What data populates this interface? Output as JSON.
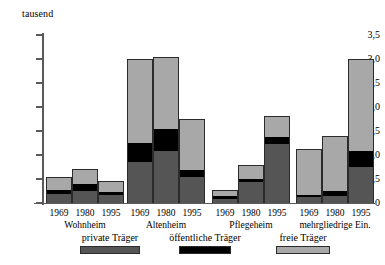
{
  "chart_data": {
    "type": "bar",
    "title": "",
    "subtitle": "",
    "unit_label": "tausend",
    "xlabel": "",
    "ylabel": "tausend",
    "ylim": [
      0,
      3.5
    ],
    "y_ticks": [
      "0",
      "0,5",
      "1,0",
      "1,5",
      "2,0",
      "2,5",
      "3,0",
      "3,5"
    ],
    "y_tick_values": [
      0,
      0.5,
      1.0,
      1.5,
      2.0,
      2.5,
      3.0,
      3.5
    ],
    "grid": false,
    "stacked": true,
    "legend_position": "bottom",
    "legend": [
      {
        "name": "private Träger",
        "color": "#555555"
      },
      {
        "name": "öffentliche Träger",
        "color": "#000000"
      },
      {
        "name": "freie Träger",
        "color": "#a8a8a8"
      }
    ],
    "series": [
      {
        "name": "private Träger",
        "color": "#555555",
        "values": [
          0.2,
          0.25,
          0.18,
          0.85,
          1.1,
          0.55,
          0.1,
          0.45,
          1.25,
          0.12,
          0.15,
          0.75
        ]
      },
      {
        "name": "öffentliche Träger",
        "color": "#000000",
        "values": [
          0.08,
          0.15,
          0.07,
          0.4,
          0.45,
          0.15,
          0.05,
          0.07,
          0.15,
          0.05,
          0.1,
          0.35
        ]
      },
      {
        "name": "freie Träger",
        "color": "#a8a8a8",
        "values": [
          0.27,
          0.3,
          0.2,
          1.75,
          1.5,
          1.05,
          0.13,
          0.28,
          0.42,
          0.95,
          1.15,
          1.9
        ]
      }
    ],
    "categories": [
      "1969",
      "1980",
      "1995",
      "1969",
      "1980",
      "1995",
      "1969",
      "1980",
      "1995",
      "1969",
      "1980",
      "1995"
    ],
    "groups": [
      {
        "label": "Wohnheim",
        "bars": [
          {
            "year": "1969",
            "private": 0.2,
            "oeffentlich": 0.08,
            "freie": 0.27,
            "total": 0.55
          },
          {
            "year": "1980",
            "private": 0.25,
            "oeffentlich": 0.15,
            "freie": 0.3,
            "total": 0.7
          },
          {
            "year": "1995",
            "private": 0.18,
            "oeffentlich": 0.07,
            "freie": 0.2,
            "total": 0.45
          }
        ]
      },
      {
        "label": "Altenheim",
        "bars": [
          {
            "year": "1969",
            "private": 0.85,
            "oeffentlich": 0.4,
            "freie": 1.75,
            "total": 3.0
          },
          {
            "year": "1980",
            "private": 1.1,
            "oeffentlich": 0.45,
            "freie": 1.5,
            "total": 3.05
          },
          {
            "year": "1995",
            "private": 0.55,
            "oeffentlich": 0.15,
            "freie": 1.05,
            "total": 1.75
          }
        ]
      },
      {
        "label": "Pflegeheim",
        "bars": [
          {
            "year": "1969",
            "private": 0.1,
            "oeffentlich": 0.05,
            "freie": 0.13,
            "total": 0.28
          },
          {
            "year": "1980",
            "private": 0.45,
            "oeffentlich": 0.07,
            "freie": 0.28,
            "total": 0.8
          },
          {
            "year": "1995",
            "private": 1.25,
            "oeffentlich": 0.15,
            "freie": 0.42,
            "total": 1.82
          }
        ]
      },
      {
        "label": "mehrgliedrige Ein.",
        "bars": [
          {
            "year": "1969",
            "private": 0.12,
            "oeffentlich": 0.05,
            "freie": 0.95,
            "total": 1.12
          },
          {
            "year": "1980",
            "private": 0.15,
            "oeffentlich": 0.1,
            "freie": 1.15,
            "total": 1.4
          },
          {
            "year": "1995",
            "private": 0.75,
            "oeffentlich": 0.35,
            "freie": 1.9,
            "total": 3.0
          }
        ]
      }
    ]
  }
}
